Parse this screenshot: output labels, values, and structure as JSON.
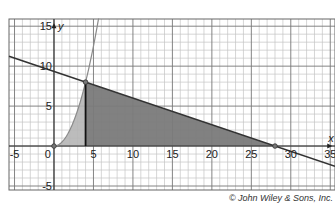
{
  "chart_data": {
    "type": "line",
    "title": "",
    "xlabel": "x",
    "ylabel": "y",
    "xlim": [
      -5.7,
      35.6
    ],
    "ylim": [
      -5.5,
      15.9
    ],
    "grid": true,
    "grid_minor_step": 1,
    "grid_major_step": 5,
    "x_ticks": [
      -5,
      0,
      5,
      10,
      15,
      20,
      25,
      30,
      35
    ],
    "y_ticks": [
      -5,
      5,
      10,
      15
    ],
    "x_tick_labels": [
      "-5",
      "0",
      "5",
      "10",
      "15",
      "20",
      "25",
      "30",
      "35"
    ],
    "y_tick_labels": [
      "-5",
      "5",
      "10",
      "15"
    ],
    "series": [
      {
        "name": "parabola",
        "equation": "y = x^2 / 2",
        "color": "#888888",
        "x": [
          0,
          1,
          2,
          3,
          4,
          5,
          5.6
        ],
        "y": [
          0,
          0.5,
          2,
          4.5,
          8,
          12.5,
          15.7
        ]
      },
      {
        "name": "line",
        "equation": "y = (28 - x) / 3",
        "color": "#333333",
        "x": [
          -5.7,
          0,
          4,
          28,
          35.6
        ],
        "y": [
          11.23,
          9.33,
          8,
          0,
          -2.53
        ]
      },
      {
        "name": "vertical segment",
        "equation": "x = 4",
        "color": "#222222",
        "x": [
          4,
          4
        ],
        "y": [
          0,
          8
        ]
      }
    ],
    "shaded_regions": [
      {
        "name": "region under parabola",
        "bounds": "0 <= x <= 4, 0 <= y <= x^2/2",
        "color": "#b5b5b5"
      },
      {
        "name": "region under line",
        "bounds": "4 <= x <= 28, 0 <= y <= (28-x)/3",
        "color": "#7a7a7a"
      }
    ],
    "points": [
      {
        "label": "origin",
        "x": 0,
        "y": 0
      },
      {
        "label": "intersection",
        "x": 4,
        "y": 8
      },
      {
        "label": "x-intercept",
        "x": 28,
        "y": 0
      }
    ],
    "annotations": [
      "© John Wiley & Sons, Inc."
    ]
  },
  "labels": {
    "x_axis": "x",
    "y_axis": "y",
    "credit": "© John Wiley & Sons, Inc."
  }
}
